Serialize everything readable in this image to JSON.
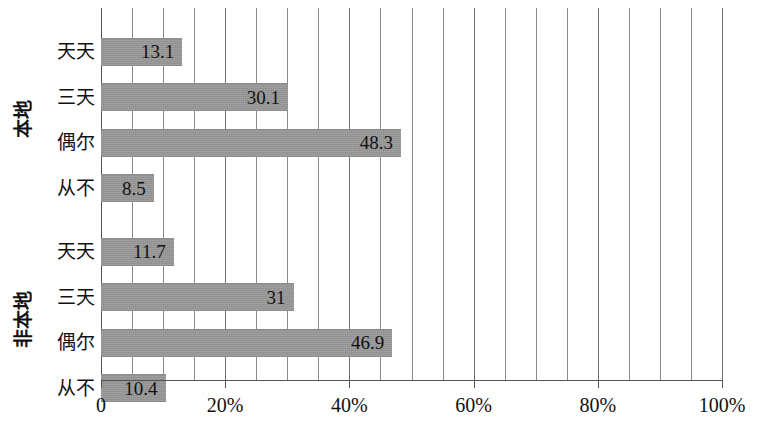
{
  "chart_data": {
    "type": "bar",
    "orientation": "horizontal",
    "title": "",
    "subtitle": "",
    "xlabel": "",
    "ylabel": "",
    "xlim": [
      0,
      100
    ],
    "grid": true,
    "legend": false,
    "legend_position": "none",
    "bar_color": "#969696",
    "axis_color": "#555555",
    "gridline_color": "#8a8a8a",
    "x_ticks": [
      {
        "value": 0,
        "label": "0"
      },
      {
        "value": 20,
        "label": "20%"
      },
      {
        "value": 40,
        "label": "40%"
      },
      {
        "value": 60,
        "label": "60%"
      },
      {
        "value": 80,
        "label": "80%"
      },
      {
        "value": 100,
        "label": "100%"
      }
    ],
    "minor_gridline_step": 5,
    "groups": [
      {
        "name": "本地",
        "categories": [
          "天天",
          "三天",
          "偶尔",
          "从不"
        ],
        "values": [
          13.1,
          30.1,
          48.3,
          8.5
        ],
        "value_labels": [
          "13.1",
          "30.1",
          "48.3",
          "8.5"
        ]
      },
      {
        "name": "非本地",
        "categories": [
          "天天",
          "三天",
          "偶尔",
          "从不"
        ],
        "values": [
          11.7,
          31.0,
          46.9,
          10.4
        ],
        "value_labels": [
          "11.7",
          "31",
          "46.9",
          "10.4"
        ]
      }
    ]
  }
}
